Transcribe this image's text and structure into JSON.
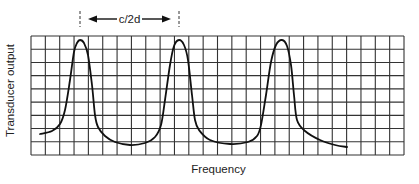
{
  "figure": {
    "type": "schematic-plot",
    "xlabel": "Frequency",
    "ylabel": "Transducer output",
    "annotation": {
      "label": "c/2d",
      "meaning": "spacing between adjacent resonance peaks",
      "from_peak": 1,
      "to_peak": 2
    },
    "grid": {
      "columns": 26,
      "rows": 9
    },
    "colors": {
      "line": "#111111",
      "grid": "#333333",
      "text": "#222222"
    }
  },
  "chart_data": {
    "type": "line",
    "title": "",
    "xlabel": "Frequency",
    "ylabel": "Transducer output",
    "grid": true,
    "legend": null,
    "ticks": {
      "x": [],
      "y": []
    },
    "annotations": [
      {
        "text": "c/2d",
        "type": "double-arrow",
        "between": "peak 1 and peak 2"
      }
    ],
    "series": [
      {
        "name": "Transducer output",
        "description": "periodic resonance peaks separated by c/2d",
        "points_pixel": [
          [
            40,
            134
          ],
          [
            52,
            131
          ],
          [
            60,
            124
          ],
          [
            65,
            110
          ],
          [
            70,
            80
          ],
          [
            74,
            52
          ],
          [
            77,
            43
          ],
          [
            80,
            40
          ],
          [
            84,
            43
          ],
          [
            88,
            55
          ],
          [
            92,
            85
          ],
          [
            95,
            115
          ],
          [
            98,
            127
          ],
          [
            105,
            136
          ],
          [
            115,
            142
          ],
          [
            130,
            145
          ],
          [
            145,
            143
          ],
          [
            155,
            137
          ],
          [
            161,
            125
          ],
          [
            165,
            100
          ],
          [
            170,
            65
          ],
          [
            174,
            46
          ],
          [
            179,
            40
          ],
          [
            184,
            45
          ],
          [
            188,
            60
          ],
          [
            192,
            95
          ],
          [
            195,
            120
          ],
          [
            199,
            130
          ],
          [
            210,
            140
          ],
          [
            230,
            144
          ],
          [
            248,
            142
          ],
          [
            257,
            136
          ],
          [
            261,
            125
          ],
          [
            266,
            95
          ],
          [
            271,
            62
          ],
          [
            276,
            45
          ],
          [
            282,
            40
          ],
          [
            287,
            46
          ],
          [
            291,
            65
          ],
          [
            294,
            95
          ],
          [
            297,
            120
          ],
          [
            305,
            131
          ],
          [
            320,
            140
          ],
          [
            335,
            145
          ],
          [
            347,
            147
          ]
        ],
        "peaks_count": 3
      }
    ]
  }
}
